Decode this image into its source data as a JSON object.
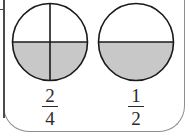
{
  "figure": {
    "type": "fraction-circles",
    "background_color": "#ffffff",
    "stroke_color": "#1a1a1a",
    "shaded_color": "#c8c8c8",
    "unshaded_color": "#ffffff",
    "frame_color": "#8e8e8e",
    "items": [
      {
        "id": "circle-quarters",
        "name": "fraction-circle-two-fourths",
        "total_parts": 4,
        "shaded_parts": 2,
        "division": "quarters",
        "divider_lines": [
          "horizontal",
          "vertical"
        ],
        "shaded_regions": [
          "bottom-left",
          "bottom-right"
        ],
        "label": {
          "numerator": "2",
          "denominator": "4",
          "text": "2/4"
        }
      },
      {
        "id": "circle-halves",
        "name": "fraction-circle-one-half",
        "total_parts": 2,
        "shaded_parts": 1,
        "division": "halves",
        "divider_lines": [
          "horizontal"
        ],
        "shaded_regions": [
          "bottom"
        ],
        "label": {
          "numerator": "1",
          "denominator": "2",
          "text": "1/2"
        }
      }
    ]
  }
}
